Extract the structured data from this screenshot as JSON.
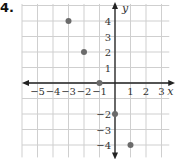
{
  "problem_number": "4.",
  "chart_data": {
    "type": "scatter",
    "title": "",
    "xlabel": "x",
    "ylabel": "y",
    "xlim": [
      -6,
      3.5
    ],
    "ylim": [
      -4.8,
      5.1
    ],
    "grid": true,
    "x_ticks": [
      -5,
      -4,
      -3,
      -2,
      -1,
      1,
      2,
      3
    ],
    "y_ticks": [
      4,
      3,
      2,
      1,
      -2,
      -3,
      -4
    ],
    "x_tick_labels": [
      "−5",
      "−4",
      "−3",
      "−2",
      "−1",
      "1",
      "2",
      "3"
    ],
    "y_tick_labels": [
      "4",
      "3",
      "2",
      "1",
      "−2",
      "−3",
      "−4"
    ],
    "points": [
      {
        "x": -3,
        "y": 4
      },
      {
        "x": -2,
        "y": 2
      },
      {
        "x": -1,
        "y": 0
      },
      {
        "x": 0,
        "y": -2
      },
      {
        "x": 1,
        "y": -4
      }
    ],
    "point_color": "#6b6b6b",
    "axis_color": "#222222",
    "grid_color": "#cfcfcf"
  }
}
